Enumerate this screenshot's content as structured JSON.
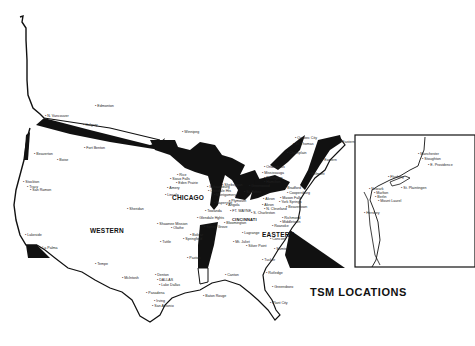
{
  "title": "TSM LOCATIONS",
  "regions": [
    {
      "label": "CHICAGO",
      "x": 172,
      "y": 194
    },
    {
      "label": "WESTERN",
      "x": 90,
      "y": 227
    },
    {
      "label": "EASTERN",
      "x": 262,
      "y": 231
    },
    {
      "label": "CINCINNATI",
      "x": 232,
      "y": 217
    }
  ],
  "cities": [
    {
      "name": "Edmonton",
      "x": 95,
      "y": 104
    },
    {
      "name": "N. Vancouver",
      "x": 45,
      "y": 114
    },
    {
      "name": "Calgary",
      "x": 83,
      "y": 123
    },
    {
      "name": "Fort Benton",
      "x": 84,
      "y": 146
    },
    {
      "name": "Beaverton",
      "x": 34,
      "y": 152
    },
    {
      "name": "Boise",
      "x": 57,
      "y": 158
    },
    {
      "name": "Stockton",
      "x": 23,
      "y": 180
    },
    {
      "name": "Tracy",
      "x": 27,
      "y": 185
    },
    {
      "name": "San Ramon",
      "x": 30,
      "y": 188
    },
    {
      "name": "Winnipeg",
      "x": 182,
      "y": 130
    },
    {
      "name": "Quebec City",
      "x": 295,
      "y": 136
    },
    {
      "name": "St. Thomas",
      "x": 293,
      "y": 142
    },
    {
      "name": "Champlain",
      "x": 287,
      "y": 151
    },
    {
      "name": "Eastern",
      "x": 340,
      "y": 140
    },
    {
      "name": "Eastern",
      "x": 322,
      "y": 158
    },
    {
      "name": "Belmont",
      "x": 309,
      "y": 172
    },
    {
      "name": "Ondenhaus",
      "x": 264,
      "y": 165
    },
    {
      "name": "Mississauga",
      "x": 262,
      "y": 171
    },
    {
      "name": "Burlington",
      "x": 264,
      "y": 176
    },
    {
      "name": "Hamilton",
      "x": 264,
      "y": 180
    },
    {
      "name": "Bradford",
      "x": 285,
      "y": 186
    },
    {
      "name": "Coopersburg",
      "x": 287,
      "y": 191
    },
    {
      "name": "Mason Falls",
      "x": 280,
      "y": 196
    },
    {
      "name": "Akron",
      "x": 263,
      "y": 197
    },
    {
      "name": "York Springs",
      "x": 279,
      "y": 200
    },
    {
      "name": "Beavertown",
      "x": 286,
      "y": 205
    },
    {
      "name": "Akron",
      "x": 262,
      "y": 203
    },
    {
      "name": "N. Cleveland",
      "x": 264,
      "y": 207
    },
    {
      "name": "S. Charleston",
      "x": 251,
      "y": 211
    },
    {
      "name": "Richmond",
      "x": 282,
      "y": 216
    },
    {
      "name": "Middletown",
      "x": 280,
      "y": 220
    },
    {
      "name": "Roanoke",
      "x": 272,
      "y": 224
    },
    {
      "name": "Concord",
      "x": 270,
      "y": 237
    },
    {
      "name": "Sumter",
      "x": 274,
      "y": 247
    },
    {
      "name": "Tucker",
      "x": 262,
      "y": 258
    },
    {
      "name": "Rutledge",
      "x": 266,
      "y": 271
    },
    {
      "name": "Greensboro",
      "x": 272,
      "y": 285
    },
    {
      "name": "Plant City",
      "x": 270,
      "y": 301
    },
    {
      "name": "Rice",
      "x": 177,
      "y": 173
    },
    {
      "name": "Sioux Falls",
      "x": 170,
      "y": 177
    },
    {
      "name": "Eden Prairie",
      "x": 176,
      "y": 181
    },
    {
      "name": "Amery",
      "x": 167,
      "y": 186
    },
    {
      "name": "Lincoln",
      "x": 165,
      "y": 193
    },
    {
      "name": "Schaumburg",
      "x": 207,
      "y": 185
    },
    {
      "name": "Glendale Hts",
      "x": 208,
      "y": 189
    },
    {
      "name": "Montgomery",
      "x": 214,
      "y": 193
    },
    {
      "name": "Naperville",
      "x": 214,
      "y": 201
    },
    {
      "name": "Plymouth",
      "x": 229,
      "y": 199
    },
    {
      "name": "Angola",
      "x": 226,
      "y": 203
    },
    {
      "name": "Towanda",
      "x": 205,
      "y": 209
    },
    {
      "name": "FT. WAYNE",
      "x": 230,
      "y": 209
    },
    {
      "name": "Glendale Hghts",
      "x": 197,
      "y": 216
    },
    {
      "name": "Bloomington",
      "x": 224,
      "y": 221
    },
    {
      "name": "Spring Grove",
      "x": 204,
      "y": 225
    },
    {
      "name": "Lagrange",
      "x": 242,
      "y": 231
    },
    {
      "name": "Mt. Juliet",
      "x": 233,
      "y": 240
    },
    {
      "name": "Silver Point",
      "x": 246,
      "y": 244
    },
    {
      "name": "Greenwood",
      "x": 249,
      "y": 184
    },
    {
      "name": "St. Johns",
      "x": 244,
      "y": 190
    },
    {
      "name": "Sheboygan",
      "x": 222,
      "y": 183
    },
    {
      "name": "Sheridan",
      "x": 127,
      "y": 207
    },
    {
      "name": "Shawnee Mission",
      "x": 157,
      "y": 222
    },
    {
      "name": "Olathe",
      "x": 171,
      "y": 226
    },
    {
      "name": "Bolivar",
      "x": 190,
      "y": 233
    },
    {
      "name": "Springfield",
      "x": 183,
      "y": 237
    },
    {
      "name": "Tuttle",
      "x": 160,
      "y": 240
    },
    {
      "name": "Paxton",
      "x": 187,
      "y": 256
    },
    {
      "name": "Canton",
      "x": 225,
      "y": 273
    },
    {
      "name": "Baton Rouge",
      "x": 203,
      "y": 294
    },
    {
      "name": "McIntosh",
      "x": 122,
      "y": 276
    },
    {
      "name": "Denton",
      "x": 155,
      "y": 273
    },
    {
      "name": "DALLAS",
      "x": 157,
      "y": 278
    },
    {
      "name": "Lake Dallas",
      "x": 159,
      "y": 283
    },
    {
      "name": "Pasadena",
      "x": 146,
      "y": 291
    },
    {
      "name": "Irving",
      "x": 154,
      "y": 299
    },
    {
      "name": "San Antonio",
      "x": 152,
      "y": 304
    },
    {
      "name": "Tempe",
      "x": 95,
      "y": 262
    },
    {
      "name": "Lakeside",
      "x": 25,
      "y": 233
    },
    {
      "name": "La Palma",
      "x": 40,
      "y": 246
    },
    {
      "name": "Manchester",
      "x": 418,
      "y": 152
    },
    {
      "name": "Stoughton",
      "x": 422,
      "y": 157
    },
    {
      "name": "E. Providence",
      "x": 428,
      "y": 163
    },
    {
      "name": "Flushing",
      "x": 388,
      "y": 175
    },
    {
      "name": "St. Plaintingen",
      "x": 401,
      "y": 186
    },
    {
      "name": "Newark",
      "x": 369,
      "y": 187
    },
    {
      "name": "Marlton",
      "x": 374,
      "y": 191
    },
    {
      "name": "Berlin",
      "x": 375,
      "y": 195
    },
    {
      "name": "Mount Laurel",
      "x": 378,
      "y": 199
    },
    {
      "name": "Hershey",
      "x": 364,
      "y": 211
    }
  ]
}
